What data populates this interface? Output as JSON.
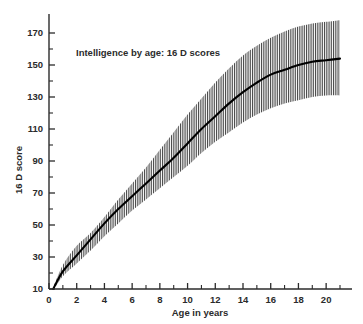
{
  "chart_data": {
    "type": "line",
    "title": "Intelligence by age:  16 D scores",
    "xlabel": "Age in years",
    "ylabel": "16 D score",
    "xlim": [
      0,
      21
    ],
    "ylim": [
      10,
      178
    ],
    "grid": false,
    "legend": null,
    "xticks": [
      0,
      2,
      4,
      6,
      8,
      10,
      12,
      14,
      16,
      18,
      20
    ],
    "xtick_labels": [
      "0",
      "2",
      "4",
      "6",
      "8",
      "10",
      "12",
      "14",
      "16",
      "18",
      "20"
    ],
    "xminor_ticks": [
      1,
      3,
      5,
      7,
      9,
      11,
      13,
      15,
      17,
      19,
      21
    ],
    "yticks": [
      10,
      30,
      50,
      70,
      90,
      110,
      130,
      150,
      170
    ],
    "ytick_labels": [
      "10",
      "30",
      "50",
      "70",
      "90",
      "110",
      "130",
      "150",
      "170"
    ],
    "yminor_ticks": [
      20,
      40,
      60,
      80,
      100,
      120,
      140,
      160
    ],
    "x": [
      0.3,
      1,
      2,
      3,
      4,
      5,
      6,
      7,
      8,
      9,
      10,
      11,
      12,
      13,
      14,
      15,
      16,
      17,
      18,
      19,
      20,
      21
    ],
    "series": [
      {
        "name": "mean 16 D score",
        "style": "solid-black-curve",
        "values": [
          10,
          21,
          31,
          41,
          51,
          60,
          68,
          76,
          84,
          92,
          101,
          110,
          118,
          126,
          133,
          139,
          144,
          147,
          150,
          152,
          153,
          154
        ]
      },
      {
        "name": "upper band limit",
        "style": "hatched-band-edge",
        "values": [
          11,
          25,
          37,
          45,
          55,
          66,
          76,
          86,
          97,
          108,
          119,
          129,
          139,
          148,
          156,
          162,
          167,
          171,
          174,
          176,
          177,
          178
        ]
      },
      {
        "name": "lower band limit",
        "style": "hatched-band-edge",
        "values": [
          9,
          18,
          26,
          34,
          43,
          51,
          59,
          66,
          73,
          80,
          87,
          95,
          102,
          108,
          114,
          119,
          123,
          126,
          128,
          130,
          131,
          131
        ]
      }
    ],
    "band": {
      "name": "range of individual variation",
      "fill": "vertical-hatch",
      "hatch_color": "#3a3a3a",
      "hatch_spacing_px": 1.8
    },
    "colors": {
      "axis": "#2b2b2b",
      "curve": "#000000",
      "text": "#2b2b2b",
      "background": "#ffffff"
    },
    "annotations": [
      {
        "name": "chart-title-annotation",
        "text": "Intelligence by age:  16 D scores",
        "x": 2.5,
        "y": 161
      }
    ]
  }
}
